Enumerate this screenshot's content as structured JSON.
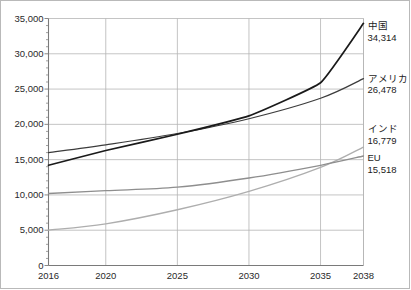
{
  "chart_data": {
    "type": "line",
    "title": "",
    "subtitle": "",
    "xlabel": "",
    "ylabel": "",
    "xlim": [
      2016,
      2038
    ],
    "ylim": [
      0,
      35000
    ],
    "grid": "both-major",
    "legend_position": "right-inline-annotations",
    "x": [
      2016,
      2020,
      2025,
      2030,
      2035,
      2038
    ],
    "xtick_labels": [
      "2016",
      "2020",
      "2025",
      "2030",
      "2035",
      "2038"
    ],
    "ytick_labels": [
      "0",
      "5,000",
      "10,000",
      "15,000",
      "20,000",
      "25,000",
      "30,000",
      "35,000"
    ],
    "ytick_values": [
      0,
      5000,
      10000,
      15000,
      20000,
      25000,
      30000,
      35000
    ],
    "yminor_step": 1000,
    "series": [
      {
        "name": "中国",
        "end_value_label": "34,314",
        "color": "#1a1a1a",
        "width": 1.7,
        "values": [
          14200,
          16300,
          18600,
          21200,
          25900,
          34314
        ]
      },
      {
        "name": "アメリカ",
        "end_value_label": "26,478",
        "color": "#3c3c3c",
        "width": 1.2,
        "values": [
          16000,
          17100,
          18700,
          20800,
          23700,
          26478
        ]
      },
      {
        "name": "インド",
        "end_value_label": "16,779",
        "color": "#aeaeae",
        "width": 1.3,
        "values": [
          5000,
          5900,
          7900,
          10500,
          13900,
          16779
        ]
      },
      {
        "name": "EU",
        "end_value_label": "15,518",
        "color": "#8e8e8e",
        "width": 1.3,
        "values": [
          10200,
          10600,
          11100,
          12400,
          14200,
          15518
        ]
      }
    ],
    "annotations": [
      {
        "name": "中国",
        "value": "34,314"
      },
      {
        "name": "アメリカ",
        "value": "26,478"
      },
      {
        "name": "インド",
        "value": "16,779"
      },
      {
        "name": "EU",
        "value": "15,518"
      }
    ],
    "colors": {
      "china": "#1a1a1a",
      "america": "#3c3c3c",
      "india": "#aeaeae",
      "eu": "#8e8e8e",
      "gridline": "#b5b5b5",
      "axis": "#7a7a7a",
      "frame": "#b9b9b9",
      "text": "#2a2a2a"
    }
  }
}
